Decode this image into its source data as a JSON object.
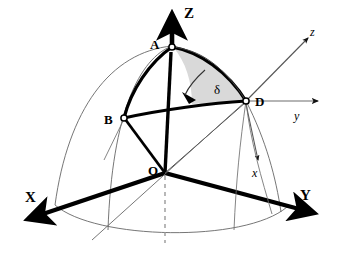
{
  "figure": {
    "kind": "geometry-diagram",
    "background_color": "#ffffff",
    "stroke_color": "#000000",
    "thin_stroke_color": "#555555",
    "wedge_fill_color": "#d9d9d9",
    "dashed_color": "#9a9a9a",
    "width": 340,
    "height": 257
  },
  "axes": {
    "global": [
      {
        "id": "axis-Z",
        "label": "Z",
        "direction": "up",
        "style": "thick"
      },
      {
        "id": "axis-X",
        "label": "X",
        "direction": "down-left",
        "style": "thick"
      },
      {
        "id": "axis-Y",
        "label": "Y",
        "direction": "down-right",
        "style": "thick"
      }
    ],
    "local": [
      {
        "id": "axis-z-local",
        "label": "z",
        "direction": "up-right",
        "style": "thin"
      },
      {
        "id": "axis-y-local",
        "label": "y",
        "direction": "right",
        "style": "thin"
      },
      {
        "id": "axis-x-local",
        "label": "x",
        "direction": "down",
        "style": "thin"
      }
    ]
  },
  "points": [
    {
      "id": "point-A",
      "label": "A",
      "marker": "open-circle",
      "x": 172,
      "y": 46
    },
    {
      "id": "point-B",
      "label": "B",
      "marker": "open-circle",
      "x": 124,
      "y": 118
    },
    {
      "id": "point-D",
      "label": "D",
      "marker": "open-circle",
      "x": 246,
      "y": 101
    },
    {
      "id": "point-O",
      "label": "O",
      "marker": "vertex",
      "x": 165,
      "y": 173
    }
  ],
  "angles": [
    {
      "id": "angle-delta",
      "label": "δ",
      "vertex": "D",
      "shaded": true,
      "fill": "#d9d9d9"
    }
  ],
  "labels": {
    "Z": "Z",
    "X": "X",
    "Y": "Y",
    "z_local": "z",
    "y_local": "y",
    "x_local": "x",
    "A": "A",
    "B": "B",
    "D": "D",
    "O": "O",
    "delta": "δ"
  }
}
